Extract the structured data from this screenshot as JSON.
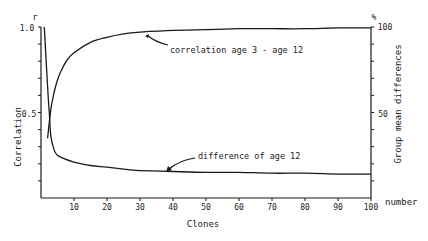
{
  "chart_data": {
    "type": "line",
    "title": "",
    "xlabel": "Clones",
    "xlabel_suffix": "number",
    "ylabel_left": "Correlation",
    "ylabel_left_unit": "r",
    "ylabel_right": "Group mean differences",
    "ylabel_right_unit": "%",
    "xlim": [
      0,
      100
    ],
    "ylim_left": [
      0,
      1.0
    ],
    "ylim_right": [
      0,
      100
    ],
    "x_ticks": [
      10,
      20,
      30,
      40,
      50,
      60,
      70,
      80,
      90,
      100
    ],
    "y_left_tick_labels": [
      "0.5",
      "1.0"
    ],
    "y_right_tick_labels": [
      "50",
      "100"
    ],
    "grid": false,
    "series": [
      {
        "name": "correlation age 3 - age 12",
        "axis": "left",
        "x": [
          2,
          3,
          4,
          5,
          6,
          8,
          10,
          15,
          20,
          25,
          30,
          40,
          50,
          60,
          70,
          80,
          90,
          100
        ],
        "y": [
          0.35,
          0.52,
          0.62,
          0.69,
          0.74,
          0.81,
          0.85,
          0.91,
          0.94,
          0.96,
          0.97,
          0.98,
          0.985,
          0.99,
          0.99,
          0.99,
          0.995,
          0.995
        ]
      },
      {
        "name": "difference of age 12",
        "axis": "right",
        "x": [
          1,
          2,
          2.5,
          3,
          4,
          5,
          7,
          10,
          15,
          20,
          27,
          30,
          40,
          50,
          60,
          70,
          80,
          90,
          100
        ],
        "y": [
          100,
          65,
          50,
          36,
          28,
          25,
          23,
          21,
          19,
          18,
          16.5,
          16,
          15.5,
          15,
          15,
          14.5,
          14.5,
          14,
          14
        ]
      }
    ],
    "annotations": [
      {
        "text": "correlation age 3 - age 12",
        "points_to": {
          "x": 30,
          "y": 0.97
        }
      },
      {
        "text": "difference of age 12",
        "points_to": {
          "x": 27,
          "y": 16.5
        }
      }
    ]
  }
}
